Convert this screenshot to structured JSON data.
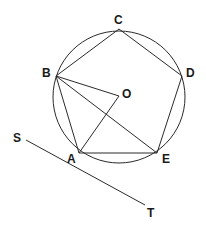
{
  "diagram": {
    "type": "geometry",
    "circle": {
      "center": "O",
      "cx": 119,
      "cy": 97,
      "r": 66
    },
    "points": {
      "A": {
        "label": "A",
        "x": 79,
        "y": 153
      },
      "B": {
        "label": "B",
        "x": 56,
        "y": 76
      },
      "C": {
        "label": "C",
        "x": 119,
        "y": 29
      },
      "D": {
        "label": "D",
        "x": 182,
        "y": 76
      },
      "E": {
        "label": "E",
        "x": 157,
        "y": 153
      },
      "O": {
        "label": "O",
        "x": 119,
        "y": 96
      },
      "S": {
        "label": "S",
        "x": 26,
        "y": 140
      },
      "T": {
        "label": "T",
        "x": 145,
        "y": 205
      }
    },
    "segments": [
      "AB",
      "BC",
      "CD",
      "DE",
      "EA",
      "BO",
      "OA",
      "BE",
      "ST"
    ],
    "stroke_color": "#2a2a2a"
  }
}
